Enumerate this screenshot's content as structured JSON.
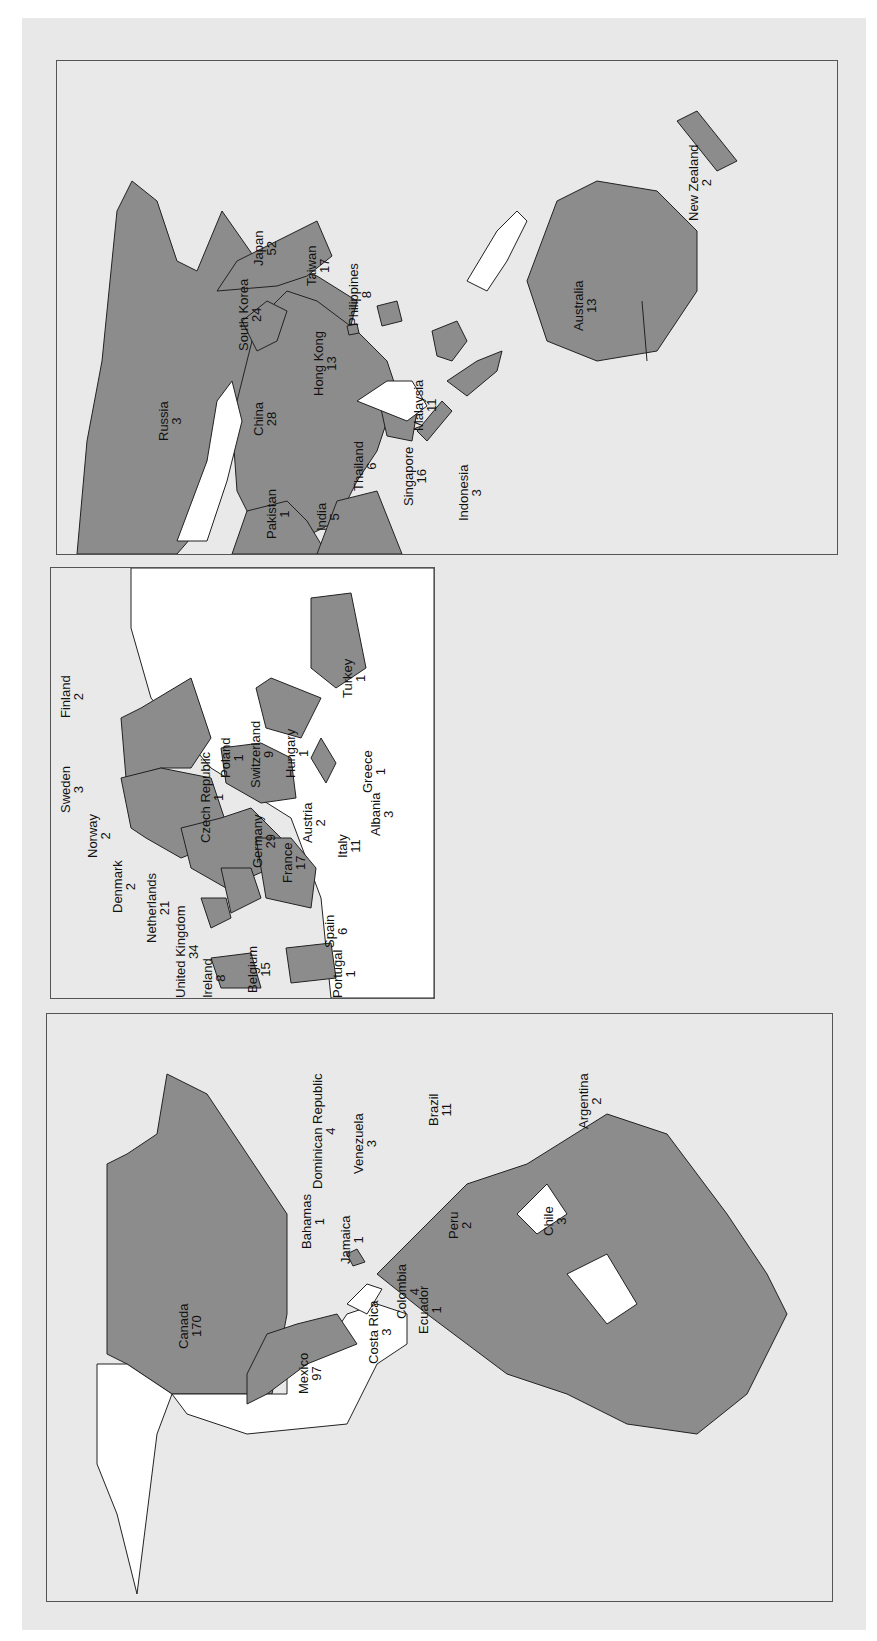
{
  "figure": {
    "orientation": "rotated 90 degrees counter-clockwise",
    "colors": {
      "background": "#e8e8e8",
      "highlighted_country": "#8c8c8c",
      "other_land": "#ffffff",
      "border": "#222222"
    }
  },
  "panels": {
    "asia_pacific": {
      "countries": [
        {
          "name": "Russia",
          "value": "3"
        },
        {
          "name": "China",
          "value": "28"
        },
        {
          "name": "Pakistan",
          "value": "1"
        },
        {
          "name": "India",
          "value": "5"
        },
        {
          "name": "South Korea",
          "value": "24"
        },
        {
          "name": "Japan",
          "value": "52"
        },
        {
          "name": "Taiwan",
          "value": "17"
        },
        {
          "name": "Hong Kong",
          "value": "13"
        },
        {
          "name": "Thailand",
          "value": "6"
        },
        {
          "name": "Philippines",
          "value": "8"
        },
        {
          "name": "Malaysia",
          "value": "11"
        },
        {
          "name": "Singapore",
          "value": "16"
        },
        {
          "name": "Indonesia",
          "value": "3"
        },
        {
          "name": "Australia",
          "value": "13"
        },
        {
          "name": "New Zealand",
          "value": "2"
        }
      ]
    },
    "europe": {
      "countries": [
        {
          "name": "Finland",
          "value": "2"
        },
        {
          "name": "Sweden",
          "value": "3"
        },
        {
          "name": "Norway",
          "value": "2"
        },
        {
          "name": "Denmark",
          "value": "2"
        },
        {
          "name": "Netherlands",
          "value": "21"
        },
        {
          "name": "United Kingdom",
          "value": "34"
        },
        {
          "name": "Ireland",
          "value": "8"
        },
        {
          "name": "Belgium",
          "value": "15"
        },
        {
          "name": "Czech Republic",
          "value": "1"
        },
        {
          "name": "Poland",
          "value": "1"
        },
        {
          "name": "Switzerland",
          "value": "9"
        },
        {
          "name": "Hungary",
          "value": "1"
        },
        {
          "name": "Germany",
          "value": "29"
        },
        {
          "name": "Austria",
          "value": "2"
        },
        {
          "name": "France",
          "value": "17"
        },
        {
          "name": "Italy",
          "value": "11"
        },
        {
          "name": "Spain",
          "value": "6"
        },
        {
          "name": "Portugal",
          "value": "1"
        },
        {
          "name": "Greece",
          "value": "1"
        },
        {
          "name": "Albania",
          "value": "3"
        },
        {
          "name": "Turkey",
          "value": "1"
        }
      ]
    },
    "americas": {
      "countries": [
        {
          "name": "Canada",
          "value": "170"
        },
        {
          "name": "Mexico",
          "value": "97"
        },
        {
          "name": "Bahamas",
          "value": "1"
        },
        {
          "name": "Dominican Republic",
          "value": "4"
        },
        {
          "name": "Jamaica",
          "value": "1"
        },
        {
          "name": "Costa Rica",
          "value": "3"
        },
        {
          "name": "Colombia",
          "value": "4"
        },
        {
          "name": "Venezuela",
          "value": "3"
        },
        {
          "name": "Ecuador",
          "value": "1"
        },
        {
          "name": "Peru",
          "value": "2"
        },
        {
          "name": "Brazil",
          "value": "11"
        },
        {
          "name": "Chile",
          "value": "3"
        },
        {
          "name": "Argentina",
          "value": "2"
        }
      ]
    }
  }
}
